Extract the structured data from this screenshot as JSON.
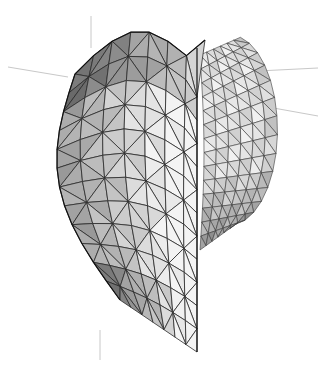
{
  "scene": {
    "subject": "3D triangulated surface mesh (shell shape)",
    "background": "#ffffff",
    "edge_color": "#2a2a2a",
    "axis_color": "#c8c8c8",
    "shade_light": "#f4f4f4",
    "shade_dark": "#555555"
  }
}
